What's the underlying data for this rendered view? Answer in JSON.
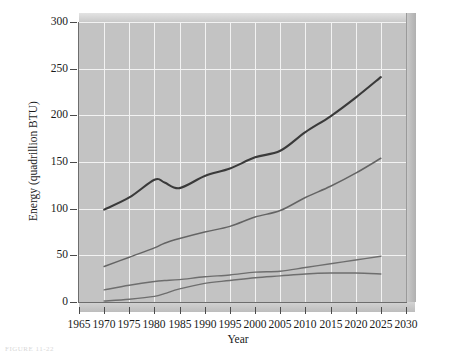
{
  "figure": {
    "caption_fragment": "FIGURE 11-22"
  },
  "chart_data": {
    "type": "line",
    "title": "",
    "xlabel": "Year",
    "ylabel": "Energy (quadrillion BTU)",
    "xlim": [
      1965,
      2030
    ],
    "ylim": [
      0,
      300
    ],
    "xticks": [
      1965,
      1970,
      1975,
      1980,
      1985,
      1990,
      1995,
      2000,
      2005,
      2010,
      2015,
      2020,
      2025,
      2030
    ],
    "yticks": [
      0,
      50,
      100,
      150,
      200,
      250,
      300
    ],
    "grid": true,
    "legend": "none",
    "plot_background": "#c3c3c3",
    "gridline_color": "#f2f2f2",
    "x": [
      1970,
      1975,
      1980,
      1982,
      1985,
      1990,
      1995,
      2000,
      2005,
      2010,
      2015,
      2020,
      2025
    ],
    "series": [
      {
        "name": "total-consumption",
        "color": "#3a3a3a",
        "width": 2.1,
        "values": [
          99,
          112,
          131,
          128,
          122,
          135,
          143,
          155,
          162,
          182,
          199,
          219,
          241
        ]
      },
      {
        "name": "second-curve",
        "color": "#646464",
        "width": 1.5,
        "values": [
          38,
          48,
          58,
          63,
          68,
          75,
          81,
          91,
          98,
          112,
          124,
          138,
          154
        ]
      },
      {
        "name": "third-curve",
        "color": "#6e6e6e",
        "width": 1.4,
        "values": [
          13,
          18,
          22,
          23,
          24,
          27,
          29,
          32,
          33,
          37,
          41,
          45,
          49
        ]
      },
      {
        "name": "fourth-curve",
        "color": "#6e6e6e",
        "width": 1.4,
        "values": [
          1,
          3,
          6,
          9,
          14,
          20,
          23,
          26,
          28,
          30,
          31,
          31,
          30
        ]
      }
    ]
  }
}
